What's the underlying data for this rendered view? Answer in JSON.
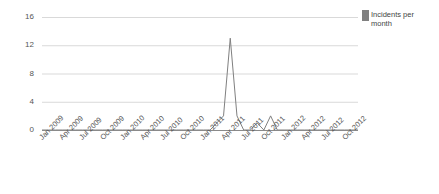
{
  "chart_data": {
    "type": "line",
    "title": "",
    "xlabel": "",
    "ylabel": "",
    "ylim": [
      0,
      16
    ],
    "yticks": [
      0,
      4,
      8,
      12,
      16
    ],
    "grid": true,
    "legend_position": "right",
    "legend": [
      "Incidents per month"
    ],
    "series_color": "#808080",
    "x": [
      "Jan 2009",
      "Feb 2009",
      "Mar 2009",
      "Apr 2009",
      "May 2009",
      "Jun 2009",
      "Jul 2009",
      "Aug 2009",
      "Sep 2009",
      "Oct 2009",
      "Nov 2009",
      "Dec 2009",
      "Jan 2010",
      "Feb 2010",
      "Mar 2010",
      "Apr 2010",
      "May 2010",
      "Jun 2010",
      "Jul 2010",
      "Aug 2010",
      "Sep 2010",
      "Oct 2010",
      "Nov 2010",
      "Dec 2010",
      "Jan 2011",
      "Feb 2011",
      "Mar 2011",
      "Apr 2011",
      "May 2011",
      "Jun 2011",
      "Jul 2011",
      "Aug 2011",
      "Sep 2011",
      "Oct 2011",
      "Nov 2011",
      "Dec 2011",
      "Jan 2012",
      "Feb 2012",
      "Mar 2012",
      "Apr 2012",
      "May 2012",
      "Jun 2012",
      "Jul 2012",
      "Aug 2012",
      "Sep 2012",
      "Oct 2012",
      "Nov 2012",
      "Dec 2012"
    ],
    "xticks": [
      "Jan 2009",
      "Apr 2009",
      "Jul 2009",
      "Oct 2009",
      "Jan 2010",
      "Apr 2010",
      "Jul 2010",
      "Oct 2010",
      "Jan 2011",
      "Apr 2011",
      "Jul 2011",
      "Oct 2011",
      "Jan 2012",
      "Apr 2012",
      "Jul 2012",
      "Oct 2012"
    ],
    "series": [
      {
        "name": "Incidents per month",
        "values": [
          0,
          0,
          0,
          0,
          0,
          0,
          0,
          0,
          0,
          0,
          0,
          0,
          0,
          0,
          0,
          0,
          0,
          0,
          0,
          0,
          0,
          0,
          0,
          0,
          0,
          0,
          1,
          2,
          13,
          2,
          0,
          0,
          1,
          0,
          2,
          0,
          0,
          0,
          0,
          0,
          0,
          0,
          0,
          0,
          0,
          0,
          0,
          0
        ]
      }
    ]
  },
  "legend": {
    "label": "Incidents per month",
    "swatch_color": "#808080"
  },
  "axes": {
    "y_tick_labels": [
      "16",
      "12",
      "8",
      "4",
      "0"
    ],
    "x_tick_labels": [
      "Jan 2009",
      "Apr 2009",
      "Jul 2009",
      "Oct 2009",
      "Jan 2010",
      "Apr 2010",
      "Jul 2010",
      "Oct 2010",
      "Jan 2011",
      "Apr 2011",
      "Jul 2011",
      "Oct 2011",
      "Jan 2012",
      "Apr 2012",
      "Jul 2012",
      "Oct 2012"
    ],
    "grid_color": "#d9d9d9",
    "axis_color": "#808080"
  }
}
